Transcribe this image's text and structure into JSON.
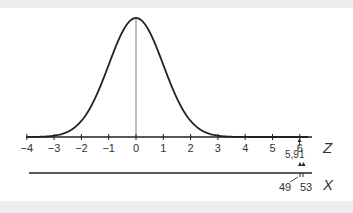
{
  "chart_data": {
    "type": "line",
    "title": "",
    "curve": "standard-normal-pdf",
    "z_axis": {
      "label": "Z",
      "ticks": [
        "−4",
        "−3",
        "−2",
        "−1",
        "0",
        "1",
        "2",
        "3",
        "4",
        "5",
        "6"
      ],
      "range": [
        -4,
        6.3
      ]
    },
    "x_axis": {
      "label": "X",
      "annotations": [
        "49",
        "53"
      ]
    },
    "annotations": [
      {
        "text": "5,91",
        "z": 5.91
      },
      {
        "text": "6",
        "z": 6
      }
    ],
    "grid": false,
    "legend": "none"
  },
  "labels": {
    "z_name": "Z",
    "x_name": "X",
    "z_ticks": [
      "−4",
      "−3",
      "−2",
      "−1",
      "0",
      "1",
      "2",
      "3",
      "4",
      "5",
      "6"
    ],
    "marker_591": "5,91",
    "x_49": "49",
    "x_53": "53"
  },
  "colors": {
    "line": "#222222",
    "band": "#ededed",
    "text": "#333333"
  }
}
